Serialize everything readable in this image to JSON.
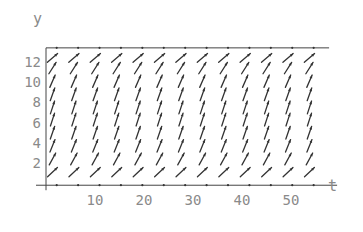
{
  "chart_data": {
    "type": "vector-field",
    "title": "",
    "xlabel": "t",
    "ylabel": "y",
    "xlim": [
      0,
      59
    ],
    "ylim": [
      -0.2,
      13.4
    ],
    "x_ticks": [
      10,
      20,
      30,
      40,
      50
    ],
    "y_ticks": [
      2,
      4,
      6,
      8,
      10,
      12
    ],
    "x_tick_labels": [
      "10",
      "20",
      "30",
      "40",
      "50"
    ],
    "y_tick_labels": [
      "2",
      "4",
      "6",
      "8",
      "10",
      "12"
    ],
    "field": {
      "description": "Direction field of an autonomous logistic-type equation dy/dt = r*y*(1 - y/K)",
      "r": 0.5,
      "K": 13.4,
      "grid_t": [
        0,
        4.37,
        8.74,
        13.11,
        17.48,
        21.85,
        26.22,
        30.59,
        34.96,
        39.33,
        43.7,
        48.07,
        52.44
      ],
      "grid_y": [
        12.4,
        11.4,
        10.1,
        8.8,
        7.5,
        6.3,
        5.0,
        3.7,
        2.4,
        1.1
      ]
    },
    "grid": false,
    "legend": "none"
  }
}
